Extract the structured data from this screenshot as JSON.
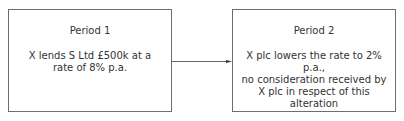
{
  "diagram": {
    "boxes": [
      {
        "title": "Period 1",
        "text": "X lends S Ltd £500k at a\nrate of 8% p.a."
      },
      {
        "title": "Period 2",
        "text": "X plc lowers the rate to 2% p.a.,\nno consideration received by\nX plc in respect of this alteration"
      }
    ],
    "arrow": {
      "from": "Period 1",
      "to": "Period 2"
    },
    "colors": {
      "border": "#6e6e6e",
      "text": "#333333",
      "arrow": "#333333"
    }
  }
}
